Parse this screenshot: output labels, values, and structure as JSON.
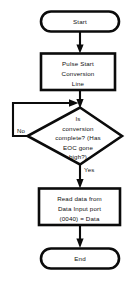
{
  "diagram": {
    "background_color": "#ffffff",
    "line_color": "#0b0b0b",
    "text_color": "#101010",
    "nodes": {
      "start": {
        "shape": "terminator",
        "label": "Start"
      },
      "pulse": {
        "shape": "process",
        "line1": "Pulse Start",
        "line2": "Conversion",
        "line3": "Line"
      },
      "decision": {
        "shape": "decision",
        "line1": "Is",
        "line2": "conversion",
        "line3": "complete? (Has",
        "line4": "EOC gone",
        "line5": "high?)"
      },
      "read": {
        "shape": "process",
        "line1": "Read data from",
        "line2": "Data Input port",
        "line3": "(0040) = Data"
      },
      "end": {
        "shape": "terminator",
        "label": "End"
      }
    },
    "edges": {
      "no_label": "No",
      "yes_label": "Yes"
    }
  }
}
